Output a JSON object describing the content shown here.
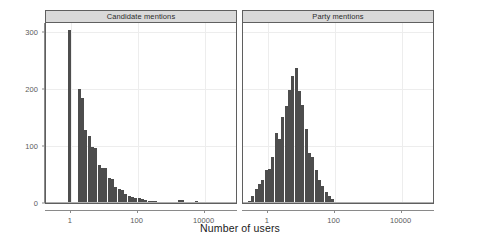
{
  "figure": {
    "xlabel": "Number of users",
    "bar_color": "#4d4d4d",
    "strip_color": "#d9d9d9",
    "border_color": "#5f5f5f"
  },
  "chart_data": {
    "type": "bar",
    "title": "",
    "xlabel": "Number of users",
    "ylabel": "",
    "xscale": "log",
    "xlim": [
      0.18,
      100000
    ],
    "ylim": [
      0,
      315
    ],
    "grid": true,
    "legend": null,
    "panels": [
      {
        "label": "Candidate mentions",
        "x_ticks": [
          1,
          100,
          10000
        ],
        "x_tick_labels": [
          "1",
          "100",
          "10000"
        ],
        "y_ticks": [
          0,
          100,
          200,
          300
        ],
        "y_tick_labels": [
          "0",
          "100",
          "200",
          "300"
        ],
        "bins_log10": [
          -0.3,
          -0.2,
          -0.1,
          0.0,
          0.1,
          0.2,
          0.3,
          0.4,
          0.5,
          0.6,
          0.7,
          0.8,
          0.9,
          1.0,
          1.1,
          1.2,
          1.3,
          1.4,
          1.5,
          1.6,
          1.7,
          1.8,
          1.9,
          2.0,
          2.1,
          2.2,
          2.3,
          2.4,
          2.5,
          2.6,
          2.7,
          2.8,
          2.9,
          3.0,
          3.1,
          3.2,
          3.3,
          3.4,
          3.5,
          3.6,
          3.7,
          3.8
        ],
        "values": [
          0,
          0,
          303,
          0,
          0,
          199,
          184,
          128,
          117,
          98,
          96,
          66,
          62,
          61,
          44,
          42,
          28,
          25,
          22,
          16,
          13,
          10,
          9,
          8,
          7,
          5,
          4,
          3,
          3,
          2,
          2,
          2,
          1,
          1,
          1,
          6,
          5,
          1,
          1,
          0,
          3,
          1
        ]
      },
      {
        "label": "Party mentions",
        "x_ticks": [
          1,
          100,
          10000
        ],
        "x_tick_labels": [
          "1",
          "100",
          "10000"
        ],
        "y_ticks": [
          0,
          100,
          200,
          300
        ],
        "y_tick_labels": [
          "0",
          "100",
          "200",
          "300"
        ],
        "bins_log10": [
          -0.6,
          -0.5,
          -0.4,
          -0.3,
          -0.2,
          -0.1,
          0.0,
          0.1,
          0.2,
          0.3,
          0.4,
          0.5,
          0.6,
          0.7,
          0.8,
          0.9,
          1.0,
          1.1,
          1.2,
          1.3,
          1.4,
          1.5,
          1.6,
          1.7,
          1.8,
          1.9,
          2.0
        ],
        "values": [
          3,
          12,
          24,
          34,
          40,
          58,
          60,
          80,
          122,
          112,
          150,
          170,
          198,
          222,
          236,
          196,
          172,
          130,
          88,
          80,
          58,
          40,
          30,
          20,
          12,
          7,
          2
        ]
      }
    ]
  }
}
